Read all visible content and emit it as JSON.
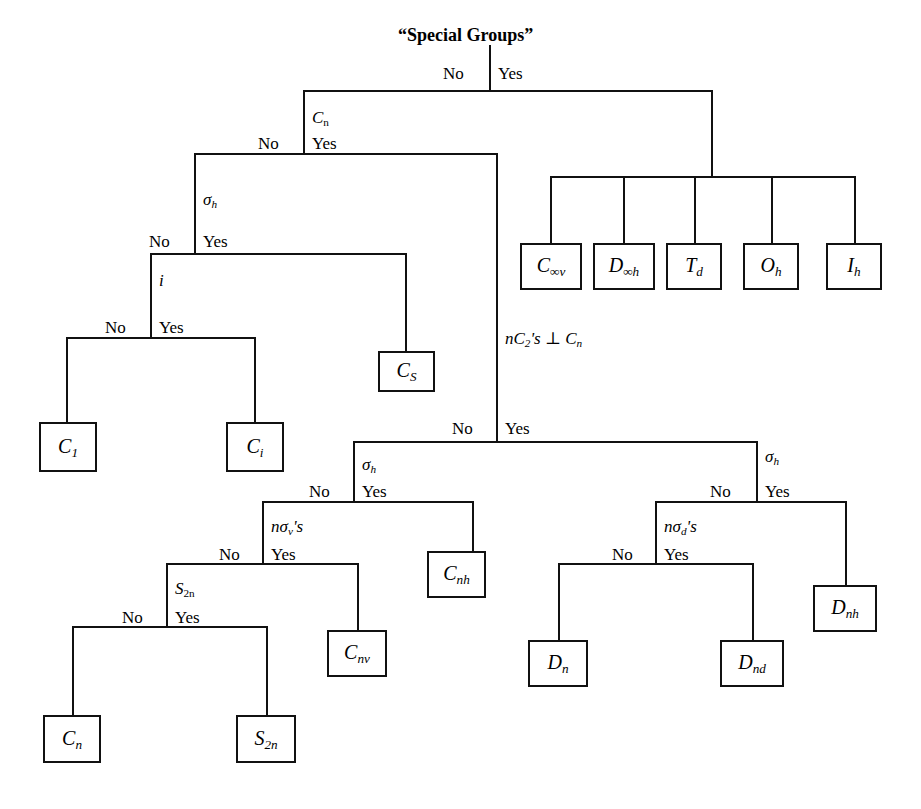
{
  "figure": {
    "title": "“Special Groups”",
    "caption": ""
  },
  "branch_labels": {
    "no": "No",
    "yes": "Yes"
  },
  "decisions": [
    {
      "id": "special-groups",
      "criterion": "“Special Groups”"
    },
    {
      "id": "cn",
      "criterion": "C",
      "criterion_sub": "n"
    },
    {
      "id": "sigma-h-left",
      "criterion": "σ",
      "criterion_sub": "h"
    },
    {
      "id": "inversion",
      "criterion": "i"
    },
    {
      "id": "nc2-perp-cn",
      "criterion": "nC₂'s ⊥ Cₙ"
    },
    {
      "id": "sigma-h-mid",
      "criterion": "σ",
      "criterion_sub": "h"
    },
    {
      "id": "n-sigma-v",
      "criterion": "nσᵥ's"
    },
    {
      "id": "s2n",
      "criterion": "S",
      "criterion_sub": "2n"
    },
    {
      "id": "sigma-h-right",
      "criterion": "σ",
      "criterion_sub": "h"
    },
    {
      "id": "n-sigma-d",
      "criterion": "nσ_d's"
    }
  ],
  "special_group_boxes": [
    {
      "id": "c-inf-v",
      "base": "C",
      "sub": "∞v"
    },
    {
      "id": "d-inf-h",
      "base": "D",
      "sub": "∞h"
    },
    {
      "id": "td",
      "base": "T",
      "sub": "d"
    },
    {
      "id": "oh",
      "base": "O",
      "sub": "h"
    },
    {
      "id": "ih",
      "base": "I",
      "sub": "h"
    }
  ],
  "result_boxes": [
    {
      "id": "cs",
      "base": "C",
      "sub": "S"
    },
    {
      "id": "c1",
      "base": "C",
      "sub": "1"
    },
    {
      "id": "ci",
      "base": "C",
      "sub": "i"
    },
    {
      "id": "cnh",
      "base": "C",
      "sub": "nh"
    },
    {
      "id": "cnv",
      "base": "C",
      "sub": "nv"
    },
    {
      "id": "cn",
      "base": "C",
      "sub": "n"
    },
    {
      "id": "s2n",
      "base": "S",
      "sub": "2n"
    },
    {
      "id": "dn",
      "base": "D",
      "sub": "n"
    },
    {
      "id": "dnd",
      "base": "D",
      "sub": "nd"
    },
    {
      "id": "dnh",
      "base": "D",
      "sub": "nh"
    }
  ],
  "labels": {
    "root_title": "“Special Groups”",
    "cn_base": "C",
    "cn_sub": "n",
    "sigma": "σ",
    "sub_h": "h",
    "i_node": "i",
    "nc2_perp": "nC",
    "nc2_sub": "2",
    "nc2_tail": "'s ⊥ C",
    "nc2_tail_sub": "n",
    "nsv_pre": "nσ",
    "nsv_sub": "v",
    "nsv_post": "'s",
    "nsd_pre": "nσ",
    "nsd_sub": "d",
    "nsd_post": "'s",
    "s2n_base": "S",
    "s2n_sub": "2n",
    "box_c_inf_v_base": "C",
    "box_c_inf_v_sub": "∞v",
    "box_d_inf_h_base": "D",
    "box_d_inf_h_sub": "∞h",
    "box_td_base": "T",
    "box_td_sub": "d",
    "box_oh_base": "O",
    "box_oh_sub": "h",
    "box_ih_base": "I",
    "box_ih_sub": "h",
    "box_cs_base": "C",
    "box_cs_sub": "S",
    "box_c1_base": "C",
    "box_c1_sub": "1",
    "box_ci_base": "C",
    "box_ci_sub": "i",
    "box_cnh_base": "C",
    "box_cnh_sub": "nh",
    "box_cnv_base": "C",
    "box_cnv_sub": "nv",
    "box_cn_base": "C",
    "box_cn_sub": "n",
    "box_s2n_base": "S",
    "box_s2n_sub": "2n",
    "box_dn_base": "D",
    "box_dn_sub": "n",
    "box_dnd_base": "D",
    "box_dnd_sub": "nd",
    "box_dnh_base": "D",
    "box_dnh_sub": "nh",
    "no": "No",
    "yes": "Yes"
  },
  "colors": {
    "line": "#111111",
    "background": "#ffffff",
    "text": "#000000"
  },
  "flow": {
    "type": "decision-tree",
    "description": "Point group determination flowchart",
    "nodes": [
      {
        "criterion": "“Special Groups”",
        "no": "Cₙ decision",
        "yes": "C∞v / D∞h / Td / Oh / Ih"
      },
      {
        "criterion": "Cₙ",
        "no": "σh decision",
        "yes": "nC₂'s ⊥ Cₙ decision"
      },
      {
        "criterion": "σh",
        "no": "i decision",
        "yes": "Cs"
      },
      {
        "criterion": "i",
        "no": "C₁",
        "yes": "Cᵢ"
      },
      {
        "criterion": "nC₂'s ⊥ Cₙ",
        "no": "σh decision (middle)",
        "yes": "σh decision (right)"
      },
      {
        "criterion": "σh (middle)",
        "no": "nσᵥ's decision",
        "yes": "Cₙh"
      },
      {
        "criterion": "nσᵥ's",
        "no": "S₂ₙ decision",
        "yes": "Cₙv"
      },
      {
        "criterion": "S₂ₙ",
        "no": "Cₙ",
        "yes": "S₂ₙ"
      },
      {
        "criterion": "σh (right)",
        "no": "nσ_d's decision",
        "yes": "Dₙh"
      },
      {
        "criterion": "nσ_d's",
        "no": "Dₙ",
        "yes": "Dₙd"
      }
    ]
  }
}
